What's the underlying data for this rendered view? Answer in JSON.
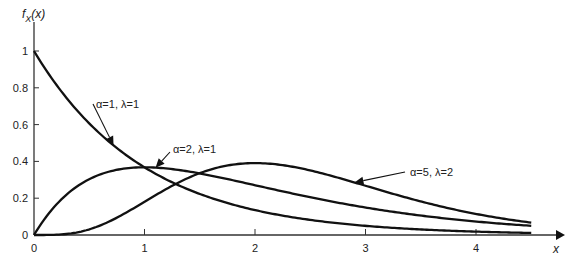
{
  "chart_data": {
    "type": "line",
    "title": "",
    "xlabel": "x",
    "ylabel": "f_X(x)",
    "ylabel_main": "f",
    "ylabel_sub": "X",
    "ylabel_arg": "(x)",
    "xlim": [
      0,
      4.5
    ],
    "ylim": [
      0,
      1.05
    ],
    "x_ticks": [
      0,
      1,
      2,
      3,
      4
    ],
    "x_tick_labels": [
      "0",
      "1",
      "2",
      "3",
      "4"
    ],
    "y_ticks": [
      0,
      0.2,
      0.4,
      0.6,
      0.8,
      1
    ],
    "y_tick_labels": [
      "0",
      "0.2",
      "0.4",
      "0.6",
      "0.8",
      "1"
    ],
    "grid": false,
    "legend": "none (curves annotated directly)",
    "series": [
      {
        "name": "α=1, λ=1",
        "alpha": 1,
        "lambda": 1,
        "x": [
          0,
          0.25,
          0.5,
          0.75,
          1,
          1.5,
          2,
          2.5,
          3,
          3.5,
          4,
          4.5
        ],
        "values": [
          1,
          0.78,
          0.61,
          0.47,
          0.37,
          0.22,
          0.14,
          0.08,
          0.05,
          0.03,
          0.02,
          0.01
        ]
      },
      {
        "name": "α=2, λ=1",
        "alpha": 2,
        "lambda": 1,
        "x": [
          0,
          0.25,
          0.5,
          0.75,
          1,
          1.5,
          2,
          2.5,
          3,
          3.5,
          4,
          4.5
        ],
        "values": [
          0,
          0.19,
          0.3,
          0.35,
          0.37,
          0.33,
          0.27,
          0.21,
          0.15,
          0.11,
          0.07,
          0.05
        ]
      },
      {
        "name": "α=5, λ=2",
        "alpha": 5,
        "lambda": 2,
        "x": [
          0,
          0.25,
          0.5,
          0.75,
          1,
          1.5,
          2,
          2.5,
          3,
          3.5,
          4,
          4.5
        ],
        "values": [
          0,
          0.0,
          0.02,
          0.06,
          0.18,
          0.34,
          0.39,
          0.34,
          0.27,
          0.19,
          0.13,
          0.09
        ]
      }
    ],
    "annotations": [
      {
        "text": "α=1, λ=1",
        "series": 0,
        "points_to_x": 0.72
      },
      {
        "text": "α=2, λ=1",
        "series": 1,
        "points_to_x": 1.1
      },
      {
        "text": "α=5, λ=2",
        "series": 2,
        "points_to_x": 2.9
      }
    ]
  }
}
